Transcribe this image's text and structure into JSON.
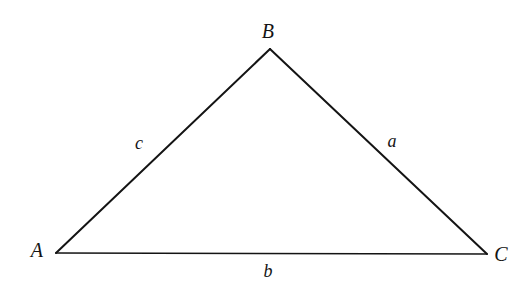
{
  "figure": {
    "name": "triangle-abc",
    "background_color": "#ffffff",
    "stroke_color": "#141414",
    "width": 528,
    "height": 292
  },
  "vertices": [
    {
      "key": "A",
      "label": "A",
      "x": 56,
      "y": 253,
      "label_x": 37,
      "label_y": 250
    },
    {
      "key": "B",
      "label": "B",
      "x": 270,
      "y": 49,
      "label_x": 268,
      "label_y": 31
    },
    {
      "key": "C",
      "label": "C",
      "x": 487,
      "y": 254,
      "label_x": 501,
      "label_y": 254
    }
  ],
  "sides": [
    {
      "key": "a",
      "label": "a",
      "from": "B",
      "to": "C",
      "label_x": 392,
      "label_y": 141,
      "stroke_width": 2
    },
    {
      "key": "b",
      "label": "b",
      "from": "A",
      "to": "C",
      "label_x": 268,
      "label_y": 271,
      "stroke_width": 1.6
    },
    {
      "key": "c",
      "label": "c",
      "from": "A",
      "to": "B",
      "label_x": 139,
      "label_y": 143,
      "stroke_width": 2
    }
  ],
  "geometry": {
    "path": "M 56 253 L 270 49 L 487 254 Z"
  }
}
